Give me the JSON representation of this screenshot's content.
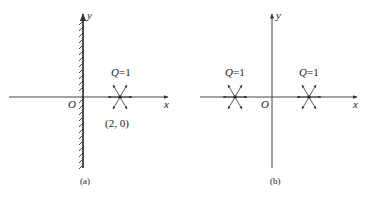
{
  "figure": {
    "panels": [
      {
        "id": "a",
        "caption": "(a)",
        "axis_x_label": "x",
        "axis_y_label": "y",
        "origin_label": "O",
        "wall": "hatched wall along y-axis (left side)",
        "sources": [
          {
            "label": "Q=1",
            "label_q": "Q",
            "label_eq": "=1",
            "coord_label": "(2,  0)"
          }
        ]
      },
      {
        "id": "b",
        "caption": "(b)",
        "axis_x_label": "x",
        "axis_y_label": "y",
        "origin_label": "O",
        "sources": [
          {
            "label": "Q=1",
            "label_q": "Q",
            "label_eq": "=1"
          },
          {
            "label": "Q=1",
            "label_q": "Q",
            "label_eq": "=1"
          }
        ]
      }
    ],
    "colors": {
      "line": "#333333",
      "text": "#222222",
      "background": "#ffffff"
    }
  }
}
